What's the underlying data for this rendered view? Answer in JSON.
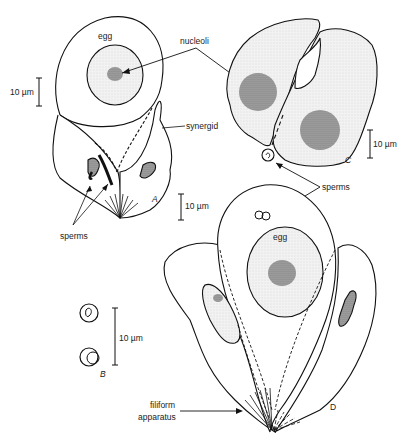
{
  "figure": {
    "panels": [
      "A",
      "B",
      "C",
      "D"
    ],
    "labels": {
      "egg_a": "egg",
      "egg_d": "egg",
      "nucleoli": "nucleoli",
      "synergid": "synergid",
      "sperms_a": "sperms",
      "sperms_cd": "sperms",
      "filiform": "filiform",
      "apparatus": "apparatus"
    },
    "scale_bars": {
      "a_left": "10 µm",
      "a_right": "10 µm",
      "b": "10 µm",
      "c": "10 µm"
    },
    "panel_letters": {
      "a": "A",
      "b": "B",
      "c": "C",
      "d": "D"
    }
  }
}
